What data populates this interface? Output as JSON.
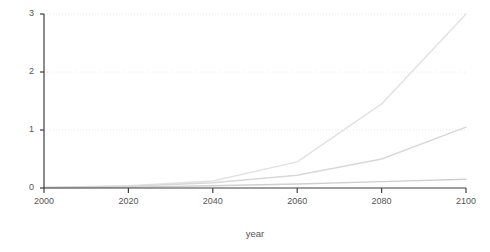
{
  "chart_data": {
    "type": "line",
    "title": "",
    "subtitle": "",
    "xlabel": "year",
    "ylabel": "$ trillion / year",
    "xlim": [
      2000,
      2100
    ],
    "ylim": [
      0,
      3
    ],
    "xticks": [
      "2000",
      "2020",
      "2040",
      "2060",
      "2080",
      "2100"
    ],
    "xtick_values": [
      2000,
      2020,
      2040,
      2060,
      2080,
      2100
    ],
    "yticks": [
      "0",
      "1",
      "2",
      "3"
    ],
    "ytick_values": [
      0,
      1,
      2,
      3
    ],
    "grid": "horizontal-dotted",
    "gridlines_at": [
      1,
      2,
      3
    ],
    "legend": "none",
    "x": [
      2000,
      2020,
      2040,
      2060,
      2080,
      2100
    ],
    "series": [
      {
        "name": "high-growth",
        "color": "#e2e2e2",
        "values": [
          0.01,
          0.04,
          0.12,
          0.45,
          1.45,
          3.0
        ]
      },
      {
        "name": "mid-growth",
        "color": "#d8d8d8",
        "values": [
          0.01,
          0.03,
          0.09,
          0.22,
          0.5,
          1.05
        ]
      },
      {
        "name": "low-growth",
        "color": "#cfcfcf",
        "values": [
          0.005,
          0.015,
          0.04,
          0.07,
          0.11,
          0.15
        ]
      }
    ]
  },
  "axes": {
    "ylabel": "$ trillion / year",
    "xlabel": "year",
    "ytick_labels": [
      "3",
      "2",
      "1",
      "0"
    ],
    "xtick_labels": [
      "2000",
      "2020",
      "2040",
      "2060",
      "2080",
      "2100"
    ]
  }
}
